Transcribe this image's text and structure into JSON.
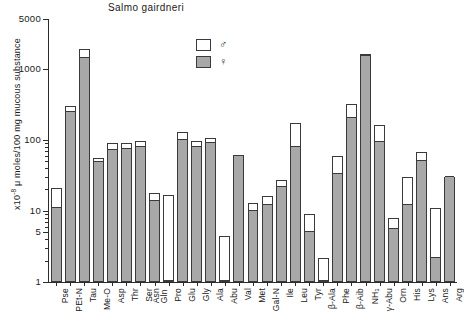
{
  "chart_data": {
    "type": "bar",
    "title": "Salmo gairdneri",
    "xlabel": "",
    "ylabel": "x10-8 μ moles/100 mg mucous substance",
    "ylabel_prefix": "x10",
    "ylabel_exp": "-8",
    "ylabel_rest": " μ moles/100 mg mucous substance",
    "scale": "log",
    "ylim": [
      1,
      5000
    ],
    "ytick_labels": [
      "5000",
      "1000",
      "100",
      "10",
      "5",
      "1"
    ],
    "ytick_values": [
      5000,
      1000,
      100,
      10,
      5,
      1
    ],
    "grid": false,
    "legend_position": "upper-right-inside",
    "stacked": true,
    "categories": [
      "Pse",
      "PEt-N",
      "Tau",
      "Me-O",
      "Asp",
      "Thr",
      "Ser",
      "Asn\nGln",
      "Pro",
      "Glu",
      "Gly",
      "Ala",
      "Abu",
      "Val",
      "Met",
      "Gal-N",
      "Ile",
      "Leu",
      "Tyr",
      "β-Ala",
      "Phe",
      "β-Aib",
      "NH₃",
      "γ-Abu",
      "Orn",
      "His",
      "Lys",
      "Ans",
      "Arg"
    ],
    "series": [
      {
        "name": "♀",
        "symbol": "♀",
        "color": "#a8a8a8",
        "values": [
          11,
          250,
          1400,
          48,
          72,
          75,
          78,
          14,
          1,
          100,
          78,
          90,
          1,
          60,
          10,
          12,
          22,
          80,
          5,
          1,
          33,
          200,
          1500,
          92,
          5.5,
          12,
          50,
          2.2,
          30
        ]
      },
      {
        "name": "♂",
        "symbol": "♂",
        "color": "#ffffff",
        "values": [
          21,
          300,
          1900,
          55,
          90,
          90,
          95,
          18,
          17,
          130,
          95,
          105,
          4.5,
          62,
          13,
          16,
          27,
          175,
          9,
          2.2,
          60,
          320,
          1600,
          160,
          8,
          30,
          68,
          11,
          30
        ]
      }
    ]
  },
  "legend": {
    "items": [
      {
        "symbol": "♂",
        "label": "male",
        "fill": "white"
      },
      {
        "symbol": "♀",
        "label": "female",
        "fill": "gray"
      }
    ]
  }
}
